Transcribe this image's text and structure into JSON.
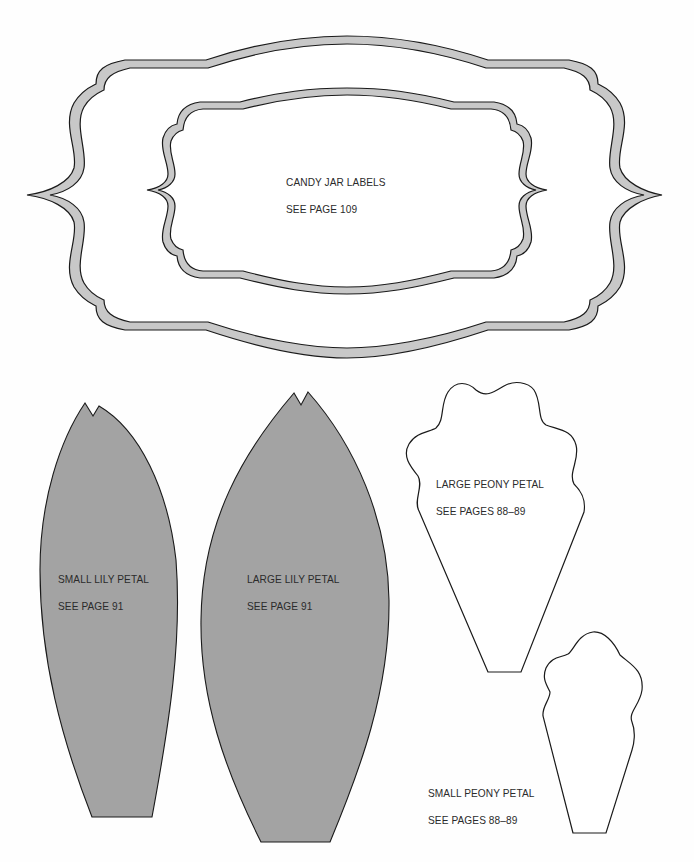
{
  "page": {
    "background": "#ffffff",
    "frame_fill": "#c8c8c8",
    "petal_fill": "#a3a3a3",
    "outline": "#1a1a1a"
  },
  "templates": {
    "candy_jar_labels": {
      "title": "CANDY JAR LABELS",
      "reference": "SEE PAGE 109",
      "count": 2
    },
    "small_lily_petal": {
      "title": "SMALL LILY PETAL",
      "reference": "SEE PAGE 91"
    },
    "large_lily_petal": {
      "title": "LARGE LILY PETAL",
      "reference": "SEE PAGE 91"
    },
    "large_peony_petal": {
      "title": "LARGE PEONY PETAL",
      "reference": "SEE PAGES 88–89"
    },
    "small_peony_petal": {
      "title": "SMALL PEONY PETAL",
      "reference": "SEE PAGES 88–89"
    }
  }
}
